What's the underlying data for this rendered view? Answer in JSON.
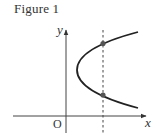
{
  "figure": {
    "title": "Figure 1",
    "axes": {
      "x_label": "x",
      "y_label": "y",
      "origin_label": "O"
    },
    "curve": {
      "type": "parabola",
      "description": "Parabola opening to the right, vertex located right of the y-axis, above the x-axis"
    },
    "vertical_line": {
      "style": "dashed",
      "description": "Vertical dashed line intersecting the parabola at two points"
    },
    "intersection_points": [
      {
        "name": "upper-intersection"
      },
      {
        "name": "lower-intersection"
      }
    ],
    "colors": {
      "stroke": "#222222",
      "text": "#333333",
      "point": "#555555",
      "axis": "#444444"
    }
  }
}
